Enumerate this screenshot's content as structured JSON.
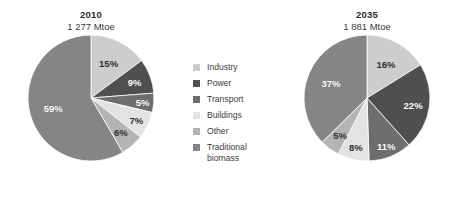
{
  "chart_data": [
    {
      "type": "pie",
      "title": "2010",
      "subtitle": "1 277 Mtoe",
      "total_label": "1 277 Mtoe",
      "total_value": 1277,
      "unit": "Mtoe",
      "categories": [
        "Industry",
        "Power",
        "Transport",
        "Buildings",
        "Other",
        "Traditional biomass"
      ],
      "values": [
        15,
        9,
        5,
        7,
        6,
        59
      ],
      "value_labels": [
        "15%",
        "9%",
        "5%",
        "7%",
        "6%",
        "59%"
      ],
      "colors": [
        "#cdcdcd",
        "#4f4f4f",
        "#6e6e6e",
        "#e3e3e3",
        "#b4b4b4",
        "#858585"
      ],
      "start_angle_deg": 0,
      "direction": "clockwise",
      "legend_position": "center",
      "grid": false
    },
    {
      "type": "pie",
      "title": "2035",
      "subtitle": "1 881 Mtoe",
      "total_label": "1 881 Mtoe",
      "total_value": 1881,
      "unit": "Mtoe",
      "categories": [
        "Industry",
        "Power",
        "Transport",
        "Buildings",
        "Other",
        "Traditional biomass"
      ],
      "values": [
        16,
        22,
        11,
        8,
        5,
        37
      ],
      "value_labels": [
        "16%",
        "22%",
        "11%",
        "8%",
        "5%",
        "37%"
      ],
      "colors": [
        "#cdcdcd",
        "#4f4f4f",
        "#6e6e6e",
        "#e3e3e3",
        "#b4b4b4",
        "#858585"
      ],
      "start_angle_deg": 0,
      "direction": "clockwise",
      "legend_position": "center",
      "grid": false
    }
  ],
  "legend": {
    "items": [
      {
        "label": "Industry",
        "color": "#cdcdcd"
      },
      {
        "label": "Power",
        "color": "#4f4f4f"
      },
      {
        "label": "Transport",
        "color": "#6e6e6e"
      },
      {
        "label": "Buildings",
        "color": "#e3e3e3"
      },
      {
        "label": "Other",
        "color": "#b4b4b4"
      },
      {
        "label": "Traditional\nbiomass",
        "color": "#858585"
      }
    ]
  },
  "left_chart": {
    "title": "2010",
    "subtitle": "1 277 Mtoe"
  },
  "right_chart": {
    "title": "2035",
    "subtitle": "1 881 Mtoe"
  }
}
